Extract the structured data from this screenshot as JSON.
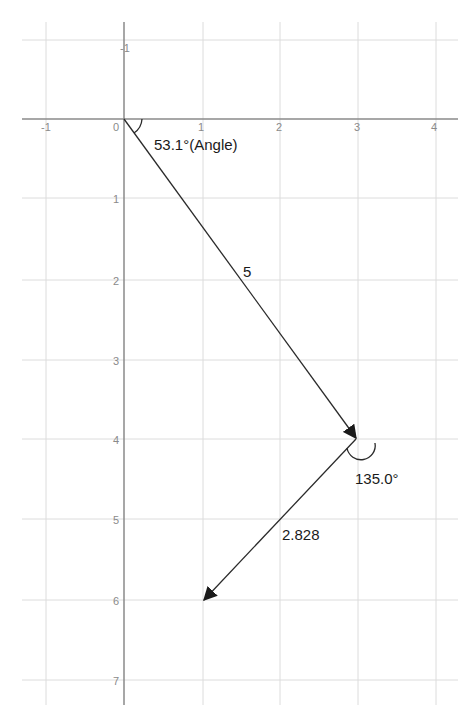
{
  "diagram": {
    "type": "vector-diagram",
    "colors": {
      "background": "#ffffff",
      "grid": "#dcdcdc",
      "axis": "#8a8a8a",
      "tick_label": "#8a8a8a",
      "vector": "#2a2a2a",
      "label": "#1a1a1a"
    },
    "x_axis": {
      "ticks": [
        "-1",
        "0",
        "1",
        "2",
        "3",
        "4"
      ],
      "range": [
        -1.3,
        4.3
      ]
    },
    "y_axis": {
      "ticks_up": [
        "-1"
      ],
      "ticks_down": [
        "1",
        "2",
        "3",
        "4",
        "5",
        "6",
        "7"
      ],
      "orientation": "positive downward",
      "range": [
        -1.2,
        7.3
      ]
    },
    "vectors": [
      {
        "name": "vector-1",
        "from": [
          0,
          0
        ],
        "to": [
          3,
          4
        ],
        "length_label": "5"
      },
      {
        "name": "vector-2",
        "from": [
          3,
          4
        ],
        "to": [
          1,
          6
        ],
        "length_label": "2.828"
      }
    ],
    "angles": [
      {
        "name": "angle-origin",
        "vertex": [
          0,
          0
        ],
        "label": "53.1°(Angle)"
      },
      {
        "name": "angle-turn",
        "vertex": [
          3,
          4
        ],
        "label": "135.0°"
      }
    ]
  }
}
